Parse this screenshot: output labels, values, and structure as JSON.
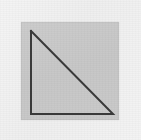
{
  "figure": {
    "canvas": {
      "width": 141,
      "height": 140
    },
    "background": {
      "outer_margin_color": "#f1f1f1",
      "inner_panel_color": "#c9c9c9",
      "inner_panel": {
        "x": 21,
        "y": 22,
        "width": 98,
        "height": 98
      }
    },
    "shape": {
      "name": "right-triangle",
      "filled": false,
      "stroke_color": "#3a3a3a",
      "stroke_width": 2,
      "right_angle_at": "bottom-left",
      "vertices": [
        {
          "label": "apex",
          "x": 31,
          "y": 31
        },
        {
          "label": "bottom-left",
          "x": 31,
          "y": 114
        },
        {
          "label": "bottom-right",
          "x": 113,
          "y": 114
        }
      ],
      "edges": [
        {
          "label": "vertical-leg",
          "from": "apex",
          "to": "bottom-left"
        },
        {
          "label": "horizontal-leg",
          "from": "bottom-left",
          "to": "bottom-right"
        },
        {
          "label": "hypotenuse",
          "from": "apex",
          "to": "bottom-right"
        }
      ],
      "points_path": "31,31 31,114 113,114 31,31"
    }
  }
}
